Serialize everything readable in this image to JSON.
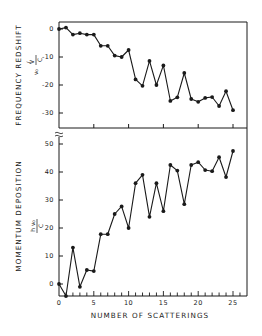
{
  "chart_data": [
    {
      "type": "line",
      "title": "",
      "xlabel": "",
      "ylabel": "FREQUENCY REDSHIFT",
      "ylabel_units": "(ν₀ V_R / C)",
      "x": [
        0,
        1,
        2,
        3,
        4,
        5,
        6,
        7,
        8,
        9,
        10,
        11,
        12,
        13,
        14,
        15,
        16,
        17,
        18,
        19,
        20,
        21,
        22,
        23,
        24,
        25
      ],
      "series": [
        {
          "name": "Frequency redshift",
          "values": [
            0,
            0.5,
            -2,
            -1.5,
            -2,
            -2,
            -6,
            -6,
            -9.5,
            -10,
            -7.5,
            -18,
            -20.3,
            -11.4,
            -20,
            -13,
            -25.7,
            -24.4,
            -15.7,
            -25,
            -26,
            -24.6,
            -24.3,
            -27.5,
            -22.2,
            -29
          ]
        }
      ],
      "yticks": [
        0,
        -10,
        -20,
        -30
      ],
      "ytick_labels": [
        "0",
        "-10",
        "-20",
        "-30"
      ],
      "xticks": [
        5,
        10,
        15,
        20,
        25
      ],
      "ylim": [
        -35.5,
        2.5
      ],
      "xlim": [
        0,
        27
      ],
      "grid": false,
      "markers": "filled-circle"
    },
    {
      "type": "line",
      "title": "",
      "xlabel": "NUMBER OF SCATTERINGS",
      "ylabel": "MOMENTUM DEPOSITION",
      "ylabel_units": "(h ν₀ / C)",
      "x": [
        0,
        1,
        2,
        3,
        4,
        5,
        6,
        7,
        8,
        9,
        10,
        11,
        12,
        13,
        14,
        15,
        16,
        17,
        18,
        19,
        20,
        21,
        22,
        23,
        24,
        25
      ],
      "series": [
        {
          "name": "Momentum deposition",
          "values": [
            0,
            -4.3,
            13,
            -1,
            5,
            4.6,
            17.8,
            17.8,
            25,
            27.7,
            20,
            36,
            39,
            24,
            36,
            26,
            42.5,
            40.5,
            28.5,
            42.5,
            43.5,
            40.7,
            40.3,
            45.3,
            38.2,
            47.5
          ]
        }
      ],
      "yticks": [
        0,
        10,
        20,
        30,
        40,
        50
      ],
      "ytick_labels": [
        "0",
        "10",
        "20",
        "30",
        "40",
        "50"
      ],
      "xticks": [
        0,
        5,
        10,
        15,
        20,
        25
      ],
      "xtick_labels": [
        "0",
        "5",
        "10",
        "15",
        "20",
        "25"
      ],
      "ylim": [
        -4.5,
        53
      ],
      "xlim": [
        0,
        27
      ],
      "grid": false,
      "markers": "filled-circle",
      "axis_break": "top of y-axis"
    }
  ],
  "figure": {
    "top_panel": {
      "ylabel": "FREQUENCY REDSHIFT",
      "unit_prefix": "ν₀",
      "unit_num": "V",
      "unit_sub": "R",
      "unit_den": "C",
      "ytick_labels": [
        "0",
        "-10",
        "-20",
        "-30"
      ]
    },
    "bottom_panel": {
      "ylabel": "MOMENTUM DEPOSITION",
      "unit_num": "h ν₀",
      "unit_den": "C",
      "ytick_labels": [
        "0",
        "10",
        "20",
        "30",
        "40",
        "50"
      ],
      "xtick_labels": [
        "0",
        "5",
        "10",
        "15",
        "20",
        "25"
      ]
    },
    "xlabel": "NUMBER OF SCATTERINGS",
    "colors": {
      "ink": "#1a1a1a",
      "background": "#ffffff"
    }
  }
}
